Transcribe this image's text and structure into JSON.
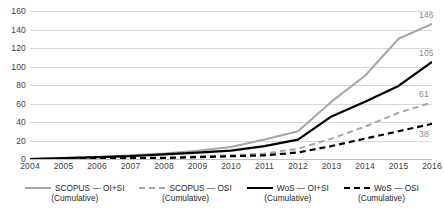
{
  "chart_data": {
    "type": "line",
    "title": "",
    "xlabel": "",
    "ylabel": "",
    "x": [
      2004,
      2005,
      2006,
      2007,
      2008,
      2009,
      2010,
      2011,
      2012,
      2013,
      2014,
      2015,
      2016
    ],
    "xtick_labels": [
      "2004",
      "2005",
      "2006",
      "2007",
      "2008",
      "2009",
      "2010",
      "2011",
      "2012",
      "2013",
      "2014",
      "2015",
      "2016"
    ],
    "ylim": [
      0,
      160
    ],
    "ytick_labels": [
      "0",
      "20",
      "40",
      "60",
      "80",
      "100",
      "120",
      "140",
      "160"
    ],
    "ytick_values": [
      0,
      20,
      40,
      60,
      80,
      100,
      120,
      140,
      160
    ],
    "grid": true,
    "legend_position": "bottom",
    "series": [
      {
        "name": "SCOPUS — OI+SI",
        "sub": "(Cumulative)",
        "style": "solid",
        "color": "#a6a6a6",
        "width": 2.0,
        "end_label": "146",
        "values": [
          0,
          1,
          2,
          4,
          6,
          9,
          13,
          21,
          30,
          62,
          90,
          130,
          146
        ]
      },
      {
        "name": "SCOPUS — OSI",
        "sub": "(Cumulative)",
        "style": "dashed",
        "color": "#a6a6a6",
        "width": 2.0,
        "end_label": "61",
        "values": [
          0,
          0,
          1,
          1,
          2,
          3,
          4,
          6,
          11,
          22,
          35,
          50,
          61
        ]
      },
      {
        "name": "WoS — OI+SI",
        "sub": "(Cumulative)",
        "style": "solid",
        "color": "#000000",
        "width": 2.2,
        "end_label": "105",
        "values": [
          0,
          1,
          2,
          3,
          5,
          7,
          9,
          14,
          21,
          46,
          62,
          79,
          105
        ]
      },
      {
        "name": "WoS — OSI",
        "sub": "(Cumulative)",
        "style": "dashed",
        "color": "#000000",
        "width": 2.2,
        "end_label": "38",
        "values": [
          0,
          0,
          0,
          1,
          1,
          2,
          3,
          4,
          7,
          14,
          22,
          30,
          38
        ]
      }
    ]
  }
}
